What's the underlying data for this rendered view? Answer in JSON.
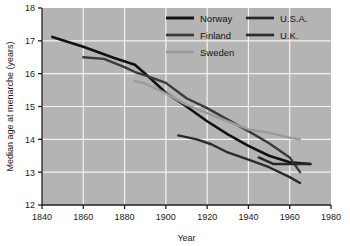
{
  "chart_data": {
    "type": "line",
    "title": "",
    "xlabel": "Year",
    "ylabel": "Median age at menarche (years)",
    "xlim": [
      1840,
      1980
    ],
    "ylim": [
      12,
      18
    ],
    "xticks": [
      1840,
      1860,
      1880,
      1900,
      1920,
      1940,
      1960,
      1980
    ],
    "yticks": [
      12,
      13,
      14,
      15,
      16,
      17,
      18
    ],
    "grid": true,
    "legend_position": "upper-right-inside",
    "plot_background": "#b4b4b4",
    "grid_color": "#f2f2f2",
    "series": [
      {
        "name": "Norway",
        "color": "#111111",
        "width": 2.6,
        "x": [
          1845,
          1860,
          1875,
          1885,
          1890,
          1900,
          1910,
          1920,
          1930,
          1940,
          1950,
          1960,
          1970
        ],
        "y": [
          17.12,
          16.82,
          16.48,
          16.27,
          16.0,
          15.42,
          15.0,
          14.55,
          14.15,
          13.8,
          13.5,
          13.3,
          13.25
        ]
      },
      {
        "name": "Finland",
        "color": "#3a3a3a",
        "width": 2.4,
        "x": [
          1860,
          1870,
          1880,
          1885,
          1890,
          1900,
          1910,
          1920,
          1930,
          1940,
          1950,
          1960,
          1965
        ],
        "y": [
          16.5,
          16.45,
          16.2,
          16.05,
          15.95,
          15.72,
          15.25,
          14.95,
          14.6,
          14.25,
          13.88,
          13.45,
          13.0
        ]
      },
      {
        "name": "Sweden",
        "color": "#9a9a9a",
        "width": 2.4,
        "x": [
          1885,
          1890,
          1900,
          1910,
          1920,
          1930,
          1940,
          1950,
          1960,
          1965
        ],
        "y": [
          15.78,
          15.7,
          15.4,
          15.05,
          14.8,
          14.55,
          14.3,
          14.2,
          14.05,
          14.0
        ]
      },
      {
        "name": "U.S.A.",
        "color": "#262626",
        "width": 2.4,
        "x": [
          1945,
          1952,
          1960,
          1970
        ],
        "y": [
          13.45,
          13.25,
          13.25,
          13.25
        ]
      },
      {
        "name": "U.K.",
        "color": "#2b2b2b",
        "width": 2.4,
        "x": [
          1906,
          1915,
          1922,
          1930,
          1940,
          1950,
          1960,
          1965
        ],
        "y": [
          14.12,
          14.0,
          13.85,
          13.6,
          13.38,
          13.15,
          12.85,
          12.67
        ]
      }
    ],
    "legend_columns": [
      [
        "Norway",
        "Finland",
        "Sweden"
      ],
      [
        "U.S.A.",
        "U.K."
      ]
    ]
  }
}
